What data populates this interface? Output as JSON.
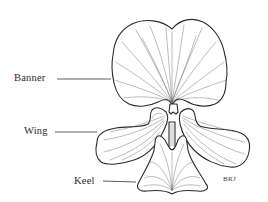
{
  "diagram": {
    "labels": [
      {
        "id": "banner",
        "text": "Banner"
      },
      {
        "id": "wing",
        "text": "Wing"
      },
      {
        "id": "keel",
        "text": "Keel"
      }
    ],
    "signature": "BRJ",
    "colors": {
      "background": "#ffffff",
      "ink": "#2b2b2b",
      "vein": "#6a6a6a"
    }
  }
}
